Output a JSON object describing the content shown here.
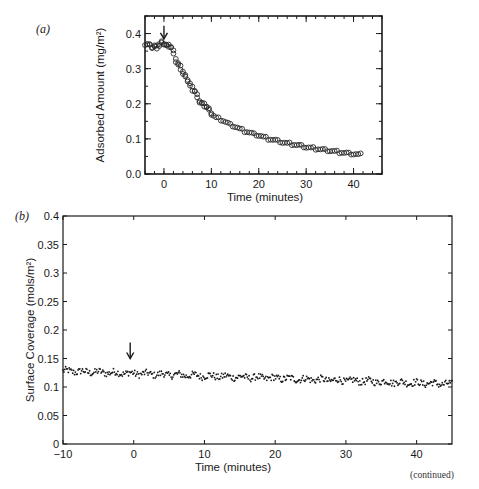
{
  "page": {
    "continued_label": "(continued)"
  },
  "chart_data": [
    {
      "panel": "(a)",
      "type": "scatter",
      "marker": "open-circle",
      "title": "",
      "xlabel": "Time  (minutes)",
      "ylabel": "Adsorbed Amount (mg/m²)",
      "xlim": [
        -4,
        46
      ],
      "ylim": [
        0.0,
        0.45
      ],
      "xticks": [
        0,
        10,
        20,
        30,
        40
      ],
      "yticks": [
        0.0,
        0.1,
        0.2,
        0.3,
        0.4
      ],
      "xtick_labels": [
        "0",
        "10",
        "20",
        "30",
        "40"
      ],
      "ytick_labels": [
        "0.0",
        "0.1",
        "0.2",
        "0.3",
        "0.4"
      ],
      "grid": false,
      "annotations": [
        {
          "type": "arrow-down",
          "x": 0,
          "y": 0.385,
          "note": "arrow marking t = 0"
        }
      ],
      "x": [
        -4,
        -3.5,
        -3,
        -2.5,
        -2,
        -1.5,
        -1,
        -0.5,
        0,
        0.5,
        1,
        1.5,
        2,
        2.5,
        3,
        3.5,
        4,
        4.5,
        5,
        5.5,
        6,
        6.5,
        7,
        7.5,
        8,
        8.5,
        9,
        9.5,
        10,
        11,
        12,
        13,
        14,
        15,
        16,
        17,
        18,
        19,
        20,
        21,
        22,
        23,
        24,
        25,
        26,
        27,
        28,
        29,
        30,
        31,
        32,
        33,
        34,
        35,
        36,
        37,
        38,
        39,
        40,
        41
      ],
      "y": [
        0.37,
        0.37,
        0.365,
        0.36,
        0.365,
        0.36,
        0.37,
        0.375,
        0.37,
        0.365,
        0.365,
        0.36,
        0.34,
        0.32,
        0.31,
        0.3,
        0.285,
        0.275,
        0.265,
        0.25,
        0.24,
        0.235,
        0.215,
        0.205,
        0.2,
        0.195,
        0.19,
        0.18,
        0.17,
        0.16,
        0.155,
        0.148,
        0.14,
        0.135,
        0.128,
        0.122,
        0.118,
        0.113,
        0.11,
        0.105,
        0.1,
        0.097,
        0.094,
        0.09,
        0.087,
        0.085,
        0.082,
        0.08,
        0.076,
        0.074,
        0.072,
        0.07,
        0.068,
        0.066,
        0.064,
        0.062,
        0.06,
        0.058,
        0.057,
        0.055
      ]
    },
    {
      "panel": "(b)",
      "type": "scatter",
      "marker": "dot",
      "title": "",
      "xlabel": "Time (minutes)",
      "ylabel": "Surface Coverage (mols/m²)",
      "xlim": [
        -10,
        45
      ],
      "ylim": [
        0,
        0.4
      ],
      "xticks": [
        -10,
        0,
        10,
        20,
        30,
        40
      ],
      "yticks": [
        0,
        0.05,
        0.1,
        0.15,
        0.2,
        0.25,
        0.3,
        0.35,
        0.4
      ],
      "xtick_labels": [
        "−10",
        "0",
        "10",
        "20",
        "30",
        "40"
      ],
      "ytick_labels": [
        "0",
        "0.05",
        "0.1",
        "0.15",
        "0.2",
        "0.25",
        "0.3",
        "0.35",
        "0.4"
      ],
      "grid": false,
      "annotations": [
        {
          "type": "arrow-down",
          "x": -0.5,
          "y": 0.15,
          "note": "arrow marking t = 0"
        }
      ],
      "trend": {
        "start": {
          "x": -10,
          "y": 0.128
        },
        "end": {
          "x": 45,
          "y": 0.105
        },
        "noise": 0.006,
        "n_points": 440
      }
    }
  ]
}
